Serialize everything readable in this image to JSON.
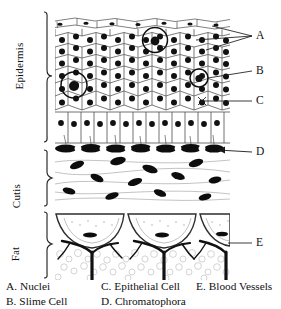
{
  "figure": {
    "layer_labels": [
      {
        "id": "epidermis",
        "text": "Epidermis"
      },
      {
        "id": "cutis",
        "text": "Cutis"
      },
      {
        "id": "fat",
        "text": "Fat"
      }
    ],
    "callouts": [
      {
        "id": "A",
        "text": "A",
        "x": 258,
        "y": 36,
        "target": "nuclei"
      },
      {
        "id": "B",
        "text": "B",
        "x": 258,
        "y": 71,
        "target": "slime-cell"
      },
      {
        "id": "C",
        "text": "C",
        "x": 258,
        "y": 101,
        "target": "epithelial-cell"
      },
      {
        "id": "D",
        "text": "D",
        "x": 258,
        "y": 155,
        "target": "chromatophora"
      },
      {
        "id": "E",
        "text": "E",
        "x": 258,
        "y": 243,
        "target": "blood-vessels"
      }
    ],
    "legend": [
      {
        "key": "A.",
        "label": "Nuclei",
        "col": 0,
        "row": 0
      },
      {
        "key": "B.",
        "label": "Slime Cell",
        "col": 0,
        "row": 1
      },
      {
        "key": "C.",
        "label": "Epithelial Cell",
        "col": 1,
        "row": 0
      },
      {
        "key": "D.",
        "label": "Chromatophora",
        "col": 1,
        "row": 1
      },
      {
        "key": "E.",
        "label": "Blood Vessels",
        "col": 2,
        "row": 0
      }
    ],
    "colors": {
      "ink": "#000000",
      "line": "#3a3a3a",
      "hairline": "#888888",
      "paper": "#ffffff",
      "stipple": "#b9b9b9"
    }
  }
}
